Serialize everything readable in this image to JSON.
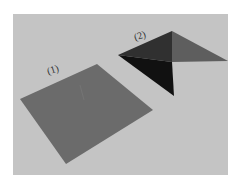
{
  "figure": {
    "background_color": "#c4c4c4",
    "shapes": [
      {
        "label": "(1)",
        "description": "flat square sheet",
        "color": "#6b6b6b",
        "vertices": [
          [
            20,
            99
          ],
          [
            97,
            64
          ],
          [
            153,
            110
          ],
          [
            66,
            164
          ]
        ]
      },
      {
        "label": "(2)",
        "description": "folded sheet",
        "faces": [
          {
            "name": "left-upper",
            "color": "#303030",
            "vertices": [
              [
                118,
                55
              ],
              [
                172,
                31
              ],
              [
                172,
                62
              ]
            ]
          },
          {
            "name": "left-lower",
            "color": "#111111",
            "vertices": [
              [
                118,
                55
              ],
              [
                172,
                62
              ],
              [
                174,
                96
              ]
            ]
          },
          {
            "name": "right-upper",
            "color": "#5e5e5e",
            "vertices": [
              [
                172,
                31
              ],
              [
                228,
                61
              ],
              [
                172,
                62
              ]
            ]
          }
        ]
      }
    ]
  }
}
